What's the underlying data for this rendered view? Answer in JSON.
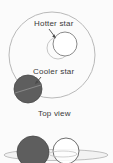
{
  "figure": {
    "background_color": "#fbfbfb",
    "width": 113,
    "height": 163
  },
  "labels": {
    "hotter_star": "Hotter star",
    "cooler_star": "Cooler star"
  },
  "captions": {
    "top_view": "Top view"
  },
  "colors": {
    "orbit_line": "#b4b4b4",
    "hotter_star_outline": "#7d7d7d",
    "hotter_star_fill": "#ffffff",
    "cooler_star_fill": "#5e5e5e",
    "cooler_star_outline": "#4a4a4a",
    "text": "#3a3a3a",
    "arrow": "#4a4a4a"
  },
  "top_view": {
    "orbit": {
      "cx": 52,
      "cy": 55,
      "r": 43,
      "shape": "circle"
    },
    "hotter_star": {
      "cx": 65,
      "cy": 44,
      "r": 12
    },
    "hotter_star_secondary_circle": {
      "cx": 58,
      "cy": 48,
      "r": 11
    },
    "cooler_star": {
      "cx": 28,
      "cy": 89,
      "r": 14
    }
  },
  "side_view": {
    "orbit": {
      "cx": 56,
      "cy": 155,
      "rx": 52,
      "ry": 5,
      "shape": "ellipse"
    },
    "cooler_star": {
      "cx": 33,
      "cy": 152,
      "r": 16
    },
    "hotter_star": {
      "cx": 66,
      "cy": 151,
      "r": 13
    },
    "inner_ellipse": {
      "cx": 62,
      "cy": 154,
      "rx": 14,
      "ry": 3
    }
  }
}
